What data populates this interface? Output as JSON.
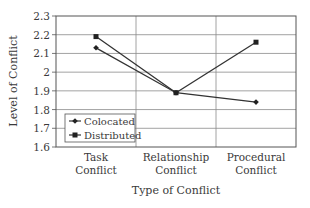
{
  "chart_data": {
    "type": "line",
    "title": "",
    "xlabel": "Type of Conflict",
    "ylabel": "Level of Conflict",
    "categories": [
      "Task Conflict",
      "Relationship Conflict",
      "Procedural Conflict"
    ],
    "category_lines": [
      [
        "Task",
        "Conflict"
      ],
      [
        "Relationship",
        "Conflict"
      ],
      [
        "Procedural",
        "Conflict"
      ]
    ],
    "ylim": [
      1.6,
      2.3
    ],
    "yticks": [
      "1.6",
      "1.7",
      "1.8",
      "1.9",
      "2",
      "2.1",
      "2.2",
      "2.3"
    ],
    "grid": true,
    "legend_position": "lower left inside",
    "series": [
      {
        "name": "Colocated",
        "marker": "diamond",
        "values": [
          2.13,
          1.89,
          1.84
        ]
      },
      {
        "name": "Distributed",
        "marker": "square",
        "values": [
          2.19,
          1.89,
          2.16
        ]
      }
    ]
  },
  "colors": {
    "line": "#333333",
    "grid": "#888888",
    "frame": "#555555"
  }
}
